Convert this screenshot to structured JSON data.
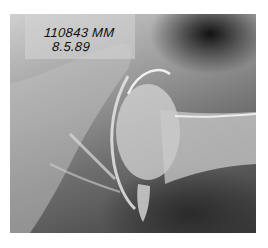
{
  "image": {
    "type": "hip radiograph",
    "annotation": {
      "patient_id": "110843 MM",
      "date": "8.5.89"
    },
    "colors": {
      "background": "#ffffff",
      "dark": "#111111",
      "bone": "#e0e0e0"
    }
  }
}
